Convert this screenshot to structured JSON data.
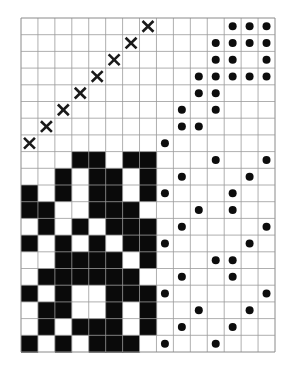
{
  "figure": {
    "grid": {
      "cols": 15,
      "rows": 20,
      "x0": 21,
      "y0": 18,
      "cell_w": 16.933,
      "cell_h": 16.7,
      "split_col": 8,
      "split_row": 8,
      "line_color": "#9a9a9a"
    },
    "marker_colors": {
      "x_mark": "#1a1a1a",
      "dot": "#0d0d0d",
      "black_cell": "#0a0a0a",
      "white_cell": "#ffffff"
    },
    "quadrants": {
      "top_left": {
        "name": "x-mark-diagonal-block",
        "marker": "x",
        "cells": [
          [
            0,
            7
          ],
          [
            1,
            6
          ],
          [
            2,
            5
          ],
          [
            3,
            4
          ],
          [
            4,
            3
          ],
          [
            5,
            2
          ],
          [
            6,
            1
          ],
          [
            7,
            0
          ]
        ]
      },
      "top_right": {
        "name": "dot-staircase-block",
        "marker": "dot",
        "cells": [
          [
            8,
            7
          ],
          [
            9,
            6
          ],
          [
            9,
            5
          ],
          [
            10,
            6
          ],
          [
            10,
            4
          ],
          [
            10,
            3
          ],
          [
            11,
            5
          ],
          [
            11,
            4
          ],
          [
            11,
            3
          ],
          [
            11,
            2
          ],
          [
            11,
            1
          ],
          [
            12,
            3
          ],
          [
            12,
            2
          ],
          [
            12,
            1
          ],
          [
            12,
            0
          ],
          [
            13,
            3
          ],
          [
            13,
            1
          ],
          [
            13,
            0
          ],
          [
            14,
            3
          ],
          [
            14,
            2
          ],
          [
            14,
            1
          ],
          [
            14,
            0
          ]
        ]
      },
      "bottom_left": {
        "name": "dense-black-white-block",
        "marker": "cell",
        "rows": [
          [
            0,
            0,
            0,
            1,
            1,
            0,
            1,
            1
          ],
          [
            0,
            0,
            1,
            0,
            1,
            1,
            0,
            1
          ],
          [
            1,
            0,
            1,
            0,
            1,
            1,
            0,
            1
          ],
          [
            1,
            1,
            0,
            0,
            1,
            1,
            1,
            0
          ],
          [
            0,
            1,
            0,
            1,
            0,
            1,
            1,
            1
          ],
          [
            1,
            0,
            1,
            0,
            1,
            0,
            1,
            1
          ],
          [
            0,
            0,
            1,
            1,
            1,
            1,
            0,
            1
          ],
          [
            0,
            1,
            1,
            1,
            1,
            1,
            1,
            0
          ],
          [
            1,
            0,
            1,
            0,
            0,
            1,
            1,
            1
          ],
          [
            0,
            1,
            1,
            0,
            0,
            1,
            0,
            1
          ],
          [
            0,
            1,
            0,
            1,
            1,
            1,
            0,
            1
          ],
          [
            1,
            0,
            1,
            0,
            1,
            1,
            1,
            0
          ]
        ]
      },
      "bottom_right": {
        "name": "sparse-dot-block",
        "marker": "dot",
        "cells": [
          [
            11,
            8
          ],
          [
            14,
            8
          ],
          [
            9,
            9
          ],
          [
            13,
            9
          ],
          [
            8,
            10
          ],
          [
            12,
            10
          ],
          [
            10,
            11
          ],
          [
            12,
            11
          ],
          [
            9,
            12
          ],
          [
            14,
            12
          ],
          [
            8,
            13
          ],
          [
            13,
            13
          ],
          [
            11,
            14
          ],
          [
            12,
            14
          ],
          [
            9,
            15
          ],
          [
            12,
            15
          ],
          [
            8,
            16
          ],
          [
            14,
            16
          ],
          [
            10,
            17
          ],
          [
            13,
            17
          ],
          [
            9,
            18
          ],
          [
            12,
            18
          ],
          [
            8,
            19
          ],
          [
            11,
            19
          ]
        ]
      }
    }
  }
}
